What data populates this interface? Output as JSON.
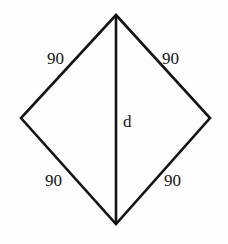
{
  "figure": {
    "kind": "geometry-diagram",
    "shape": "rhombus",
    "background_color": "#fefefe",
    "stroke_color": "#141414",
    "labels": {
      "side_top_left": "90",
      "side_top_right": "90",
      "side_bottom_left": "90",
      "side_bottom_right": "90",
      "diagonal": "d"
    },
    "geometry": {
      "vertex_top": [
        116,
        15
      ],
      "vertex_left": [
        21,
        118
      ],
      "vertex_right": [
        210,
        118
      ],
      "vertex_bottom": [
        116,
        224
      ],
      "diagonal_from": [
        116,
        15
      ],
      "diagonal_to": [
        116,
        224
      ],
      "edge_stroke_width": 2.6,
      "diagonal_stroke_width": 2.6
    }
  },
  "chart_data": {
    "type": "diagram",
    "title": "",
    "shape": "rhombus",
    "side_lengths": [
      90,
      90,
      90,
      90
    ],
    "side_labels": [
      "90",
      "90",
      "90",
      "90"
    ],
    "diagonal_label": "d",
    "vertices": [
      {
        "name": "top",
        "x": 116,
        "y": 15
      },
      {
        "name": "right",
        "x": 210,
        "y": 118
      },
      {
        "name": "bottom",
        "x": 116,
        "y": 224
      },
      {
        "name": "left",
        "x": 21,
        "y": 118
      }
    ],
    "segments": [
      {
        "from": "top",
        "to": "right",
        "label": "90"
      },
      {
        "from": "right",
        "to": "bottom",
        "label": "90"
      },
      {
        "from": "bottom",
        "to": "left",
        "label": "90"
      },
      {
        "from": "left",
        "to": "top",
        "label": "90"
      },
      {
        "from": "top",
        "to": "bottom",
        "label": "d"
      }
    ]
  }
}
